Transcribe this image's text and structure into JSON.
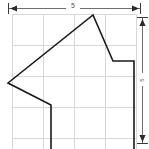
{
  "figure": {
    "background_color": "#ffffff",
    "outline_color": "#1a1a1a",
    "grid_color": "#d8d8d8",
    "dimension_color": "#6e6e6e"
  },
  "dimensions": {
    "width_label": "5",
    "height_label": "5",
    "width_label_unit": "",
    "height_label_unit": ""
  },
  "grid": {
    "visible": true,
    "columns": 4,
    "rows": 4,
    "cell_size_px": 31,
    "origin_x_px": 12,
    "origin_y_px": 14,
    "vertical_lines_x": [
      12,
      43,
      74,
      105,
      136
    ],
    "horizontal_lines_y": [
      14,
      45,
      76,
      107,
      138
    ]
  },
  "chart_data": {
    "type": "scatter",
    "xlabel": "",
    "ylabel": "",
    "xlim": [
      0,
      4
    ],
    "ylim": [
      0,
      4
    ],
    "grid": true,
    "legend": null,
    "annotations": [
      {
        "text": "5",
        "position": "top-dimension"
      },
      {
        "text": "5",
        "position": "right-dimension"
      }
    ],
    "series": [
      {
        "name": "polygon-outline",
        "closed": false,
        "points_px": [
          [
            51,
            149
          ],
          [
            51,
            105
          ],
          [
            8,
            83
          ],
          [
            93,
            15
          ],
          [
            113,
            61
          ],
          [
            134,
            61
          ],
          [
            134,
            149
          ]
        ],
        "x": [
          1.25,
          1.25,
          -0.13,
          2.6,
          3.25,
          3.9,
          3.9
        ],
        "y": [
          -0.3,
          1.05,
          1.75,
          3.95,
          2.45,
          2.45,
          -0.3
        ]
      }
    ]
  },
  "shape": {
    "path_d": "M 51 152 L 51 105 L 8 83 L 93 15 L 113 61 L 134 61 L 134 152",
    "vertex_names": [
      "bottom-left-stem",
      "notch-vertex",
      "left-point",
      "apex",
      "right-step-corner",
      "right-step-top",
      "bottom-right-stem"
    ]
  }
}
